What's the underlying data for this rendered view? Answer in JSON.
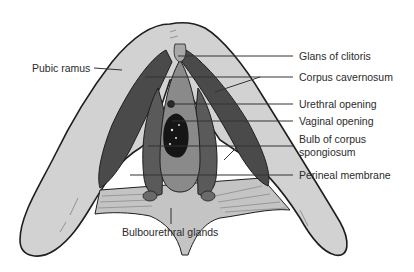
{
  "diagram": {
    "type": "anatomical illustration",
    "labels": {
      "pubic_ramus": "Pubic ramus",
      "glans_of_clitoris": "Glans of clitoris",
      "corpus_cavernosum": "Corpus cavernosum",
      "urethral_opening": "Urethral opening",
      "vaginal_opening": "Vaginal opening",
      "bulb_line1": "Bulb of corpus",
      "bulb_line2": "spongiosum",
      "perineal_membrane": "Perineal membrane",
      "bulbourethral_glands": "Bulbourethral glands"
    },
    "colors": {
      "bone": "#d2d2d2",
      "muscle_dark": "#4a4a4a",
      "bulb": "#5a5a5a",
      "vestibule": "#8a8a8a",
      "membrane": "#bdbdbd",
      "outline": "#1e1e1e",
      "leader_line": "#333333"
    }
  }
}
